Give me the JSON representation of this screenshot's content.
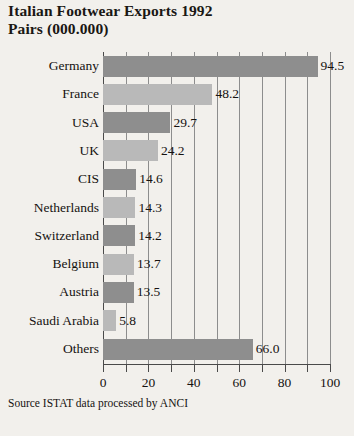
{
  "chart_data": {
    "type": "bar",
    "orientation": "horizontal",
    "title": "Italian Footwear Exports 1992 Pairs (000.000)",
    "title_lines": [
      "Italian Footwear Exports 1992",
      "Pairs (000.000)"
    ],
    "xlabel": "",
    "ylabel": "",
    "xlim": [
      0,
      100
    ],
    "x_ticks": [
      0,
      10,
      20,
      30,
      40,
      50,
      60,
      70,
      80,
      90,
      100
    ],
    "x_tick_labels": [
      "0",
      "",
      "20",
      "",
      "40",
      "",
      "60",
      "",
      "80",
      "",
      "100"
    ],
    "grid": true,
    "legend": "none",
    "categories": [
      "Germany",
      "France",
      "USA",
      "UK",
      "CIS",
      "Netherlands",
      "Switzerland",
      "Belgium",
      "Austria",
      "Saudi Arabia",
      "Others"
    ],
    "values": [
      94.5,
      48.2,
      29.7,
      24.2,
      14.6,
      14.3,
      14.2,
      13.7,
      13.5,
      5.8,
      66.0
    ],
    "value_labels": [
      "94.5",
      "48.2",
      "29.7",
      "24.2",
      "14.6",
      "14.3",
      "14.2",
      "13.7",
      "13.5",
      "5.8",
      "66.0"
    ],
    "bar_shades": [
      "dark",
      "light",
      "dark",
      "light",
      "dark",
      "light",
      "dark",
      "light",
      "dark",
      "light",
      "dark"
    ],
    "source_note": "Source ISTAT data processed by ANCI",
    "colors": {
      "background": "#f2f0ec",
      "bar_dark": "#8e8e8e",
      "bar_light": "#b9b9b9",
      "gridline": "#8d8d8d",
      "axis": "#4a4a4a",
      "text": "#151210"
    }
  }
}
